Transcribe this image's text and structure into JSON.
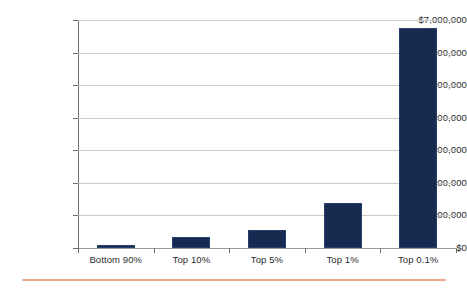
{
  "chart_data": {
    "type": "bar",
    "title": "",
    "subtitle": "",
    "xlabel": "",
    "ylabel": "",
    "categories": [
      "Bottom 90%",
      "Top 10%",
      "Top 5%",
      "Top 1%",
      "Top 0.1%"
    ],
    "values": [
      70000,
      330000,
      550000,
      1380000,
      6750000
    ],
    "series": [
      {
        "name": "Average wealth",
        "values": [
          70000,
          330000,
          550000,
          1380000,
          6750000
        ]
      }
    ],
    "ylim": [
      0,
      7000000
    ],
    "y_ticks": [
      0,
      1000000,
      2000000,
      3000000,
      4000000,
      5000000,
      6000000,
      7000000
    ],
    "y_tick_labels": [
      "$0",
      "$1,000,000",
      "$2,000,000",
      "$3,000,000",
      "$4,000,000",
      "$5,000,000",
      "$6,000,000",
      "$7,000,000"
    ],
    "grid": true,
    "grid_axis": "y",
    "legend": false,
    "legend_position": "none",
    "bar_color": "#182a50",
    "gridline_color": "#c9c9c9",
    "axis_color": "#6f6f6f",
    "background_color": "#ffffff",
    "accent_rule_color": "#e8a987"
  }
}
